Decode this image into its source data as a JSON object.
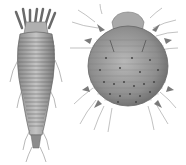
{
  "image": {
    "description": "Scientific engraving-style illustration of two mites side by side on white background",
    "background": "#ffffff",
    "subjects": [
      {
        "name": "elongated-mite",
        "description": "Long, segmented worm-like mite with four pairs of short legs near head and tapered ridged body",
        "position": "left"
      },
      {
        "name": "round-mite",
        "description": "Round, oval bodied mite with spines, dots and long bristles extending from body",
        "position": "right"
      }
    ],
    "colors": {
      "ink": "#5a5a5a",
      "shade": "#9a9a9a",
      "light": "#c8c8c8"
    }
  }
}
